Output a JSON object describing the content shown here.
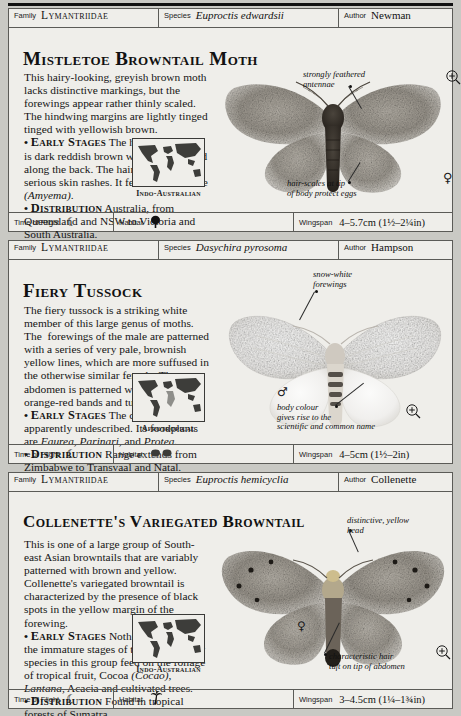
{
  "page": {
    "background_color": "#c9c9c4",
    "card_color": "#efeeea",
    "rule_color": "#111111"
  },
  "entries": [
    {
      "header": {
        "family_label": "Family",
        "family_value": "Lymantriidae",
        "species_label": "Species",
        "species_value": "Euproctis edwardsii",
        "author_label": "Author",
        "author_value": "Newman"
      },
      "title": "Mistletoe Browntail Moth",
      "description_html": "This hairy-looking, greyish brown moth lacks distinctive markings, but the forewings appear rather thinly scaled. The hindwing margins are lightly tinged tinged with yellowish brown.<br><span class='bullet'>•</span> <b>Early Stages</b> The hairy caterpillar is dark reddish brown with a white band along the back. The hairs can cause serious skin rashes. It feeds on mistletoe <i>(Amyema)</i>.<br><span class='bullet'>•</span> <b>Distribution</b> Australia, from Queensland and NSW to Victoria and South Australia.",
      "map_caption": "Indo-Australian",
      "annotations": [
        {
          "name": "antennae-annotation",
          "text": "strongly feathered<br>antennae"
        },
        {
          "name": "hair-scales-annotation",
          "text": "hair-scales at tip<br>of body protect eggs"
        }
      ],
      "sex_symbols": [
        {
          "name": "male-symbol",
          "glyph": "♂"
        },
        {
          "name": "female-symbol",
          "glyph": "♀"
        }
      ],
      "footer": {
        "time_of_flight_label": "Time of Flight",
        "time_of_flight_icon": "crescent-moon-icon",
        "time_of_flight_glyph": "☾",
        "habitat_label": "Habitat",
        "habitat_icon": "broadleaf-tree-icon",
        "habitat_glyph": "♣",
        "wingspan_label": "Wingspan",
        "wingspan_value": "4–5.7cm (1½–2¼in)"
      }
    },
    {
      "header": {
        "family_label": "Family",
        "family_value": "Lymantriidae",
        "species_label": "Species",
        "species_value": "Dasychira pyrosoma",
        "author_label": "Author",
        "author_value": "Hampson"
      },
      "title": "Fiery Tussock",
      "description_html": "The fiery tussock is a striking white member of this large genus of moths. The&nbsp; forewings of the male are patterned with a series of very pale, brownish yellow lines, which are more suffused in the otherwise similar female. The abdomen is patterned with bright orange-red bands and tufts.<br><span class='bullet'>•</span> <b>Early Stages</b> The caterpillar is apparently undescribed. Its foodplants are <i>Faurea, Parinari,</i> and <i>Protea.</i><br><span class='bullet'>•</span> <b>Distribution</b> Range extends from Zimbabwe to Transvaal and Natal.",
      "map_caption": "Afrotropical",
      "annotations": [
        {
          "name": "forewings-annotation",
          "text": "snow-white<br>forewings"
        },
        {
          "name": "body-colour-annotation",
          "text": "body colour<br>gives rise to the<br>scientific and common name"
        }
      ],
      "sex_symbols": [
        {
          "name": "male-symbol",
          "glyph": "♂"
        }
      ],
      "footer": {
        "time_of_flight_label": "Time of Flight",
        "time_of_flight_icon": "crescent-moon-icon",
        "time_of_flight_glyph": "☾",
        "habitat_label": "Habitat",
        "habitat_icon": "scrub-bushes-icon",
        "habitat_glyph": "♣♣",
        "wingspan_label": "Wingspan",
        "wingspan_value": "4–5cm (1½–2in)"
      }
    },
    {
      "header": {
        "family_label": "Family",
        "family_value": "Lymantriidae",
        "species_label": "Species",
        "species_value": "Euproctis hemicyclia",
        "author_label": "Author",
        "author_value": "Collenette"
      },
      "title": "Collenette's Variegated Browntail",
      "description_html": "This is one of a large group of South-east Asian browntails that are variably patterned with brown and yellow. Collenette's variegated browntail is characterized by the presence of black spots in the yellow margin of the forewing.<br><span class='bullet'>•</span> <b>Early Stages</b> Nothing is known of the immature stages of this moth. Many species in this group feed on the foliage of tropical fruit, Cocoa <i>(Cocao), Lantana,</i> Acacia and cultivated trees.<br><span class='bullet'>•</span> <b>Distribution</b> Found in tropical forests of Sumatra.",
      "map_caption": "Indo-Australian",
      "annotations": [
        {
          "name": "yellow-head-annotation",
          "text": "distinctive, yellow<br>head"
        },
        {
          "name": "hair-tuft-annotation",
          "text": "characteristic hair<br>tuft on tip of abdomen"
        }
      ],
      "sex_symbols": [
        {
          "name": "female-symbol",
          "glyph": "♀"
        }
      ],
      "footer": {
        "time_of_flight_label": "Time of Flight",
        "time_of_flight_icon": "crescent-moon-icon",
        "time_of_flight_glyph": "☾",
        "habitat_label": "Habitat",
        "habitat_icon": "palm-tree-icon",
        "habitat_glyph": "⚘",
        "wingspan_label": "Wingspan",
        "wingspan_value": "3–4.5cm (1¼–1¾in)"
      }
    }
  ]
}
